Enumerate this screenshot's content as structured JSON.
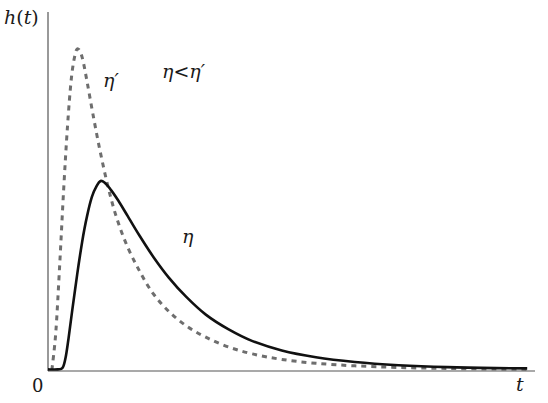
{
  "chart_data": {
    "type": "line",
    "title": "",
    "xlabel": "t",
    "ylabel": "h(t)",
    "origin_label": "0",
    "annotation": "η<η′",
    "grid": false,
    "legend": "inline labels",
    "xlim": [
      0,
      1
    ],
    "ylim": [
      0,
      1
    ],
    "series": [
      {
        "name": "η′",
        "style": "dashed",
        "color": "#6e6e6e",
        "points": [
          [
            0.008,
            0.003
          ],
          [
            0.016,
            0.12
          ],
          [
            0.024,
            0.33
          ],
          [
            0.032,
            0.56
          ],
          [
            0.04,
            0.76
          ],
          [
            0.048,
            0.91
          ],
          [
            0.056,
            0.985
          ],
          [
            0.062,
            1.0
          ],
          [
            0.07,
            0.975
          ],
          [
            0.08,
            0.9
          ],
          [
            0.092,
            0.8
          ],
          [
            0.106,
            0.69
          ],
          [
            0.122,
            0.58
          ],
          [
            0.14,
            0.48
          ],
          [
            0.162,
            0.39
          ],
          [
            0.188,
            0.31
          ],
          [
            0.216,
            0.24
          ],
          [
            0.248,
            0.185
          ],
          [
            0.284,
            0.14
          ],
          [
            0.324,
            0.105
          ],
          [
            0.37,
            0.075
          ],
          [
            0.42,
            0.053
          ],
          [
            0.48,
            0.036
          ],
          [
            0.55,
            0.024
          ],
          [
            0.63,
            0.016
          ],
          [
            0.72,
            0.011
          ],
          [
            0.82,
            0.008
          ],
          [
            0.92,
            0.006
          ],
          [
            0.984,
            0.005
          ]
        ]
      },
      {
        "name": "η",
        "style": "solid",
        "color": "#111111",
        "points": [
          [
            0.0,
            0.005
          ],
          [
            0.02,
            0.005
          ],
          [
            0.03,
            0.01
          ],
          [
            0.036,
            0.04
          ],
          [
            0.042,
            0.1
          ],
          [
            0.05,
            0.19
          ],
          [
            0.06,
            0.3
          ],
          [
            0.07,
            0.4
          ],
          [
            0.08,
            0.48
          ],
          [
            0.09,
            0.54
          ],
          [
            0.1,
            0.575
          ],
          [
            0.108,
            0.59
          ],
          [
            0.116,
            0.585
          ],
          [
            0.128,
            0.565
          ],
          [
            0.144,
            0.53
          ],
          [
            0.164,
            0.48
          ],
          [
            0.188,
            0.42
          ],
          [
            0.216,
            0.355
          ],
          [
            0.248,
            0.29
          ],
          [
            0.284,
            0.23
          ],
          [
            0.324,
            0.175
          ],
          [
            0.37,
            0.13
          ],
          [
            0.42,
            0.093
          ],
          [
            0.48,
            0.064
          ],
          [
            0.55,
            0.043
          ],
          [
            0.63,
            0.028
          ],
          [
            0.72,
            0.018
          ],
          [
            0.82,
            0.012
          ],
          [
            0.92,
            0.009
          ],
          [
            0.984,
            0.008
          ]
        ]
      }
    ],
    "labels": {
      "eta_prime": "η′",
      "eta": "η"
    }
  },
  "plot": {
    "x0": 48,
    "y0": 371,
    "width": 487,
    "height": 322,
    "axis_color": "#555555"
  }
}
